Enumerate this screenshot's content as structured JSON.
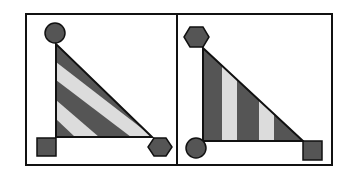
{
  "figure": {
    "colors": {
      "dark": "#555555",
      "light": "#dcdcdc",
      "stroke": "#111111",
      "background": "#ffffff"
    },
    "panels": [
      {
        "id": "left",
        "stripe_direction": "diagonal",
        "vertex_shapes": {
          "top": "circle",
          "bottom_left": "square",
          "bottom_right": "hexagon"
        }
      },
      {
        "id": "right",
        "stripe_direction": "vertical",
        "vertex_shapes": {
          "top": "hexagon",
          "bottom_left": "circle",
          "bottom_right": "square"
        }
      }
    ]
  }
}
